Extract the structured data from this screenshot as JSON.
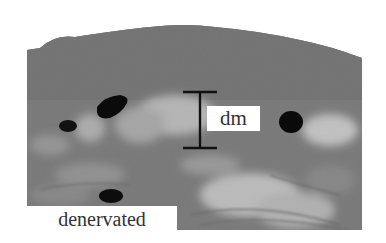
{
  "figure": {
    "type": "grayscale histology micrograph",
    "labels": {
      "measurement": "dm",
      "condition": "denervated"
    },
    "colors": {
      "tissue_dark": "#6f6f6f",
      "tissue_mid": "#8a8a8a",
      "tissue_light": "#d8d8d8",
      "nuclei": "#0a0a0a",
      "scale_bar": "#111111",
      "background": "#ffffff"
    }
  }
}
